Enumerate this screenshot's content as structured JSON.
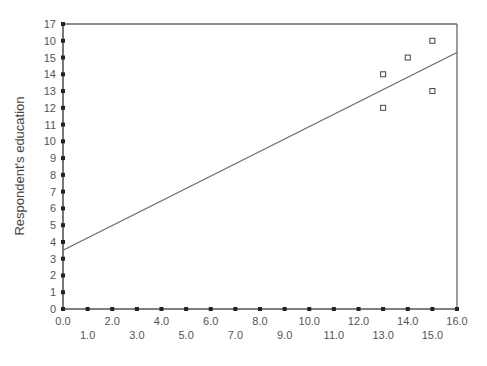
{
  "chart_data": {
    "type": "scatter",
    "title": "",
    "xlabel": "",
    "ylabel": "Respondent's education",
    "xlim": [
      0,
      16
    ],
    "ylim": [
      0,
      17
    ],
    "x_ticks": [
      0,
      1,
      2,
      3,
      4,
      5,
      6,
      7,
      8,
      9,
      10,
      11,
      12,
      13,
      14,
      15,
      16
    ],
    "x_tick_labels": [
      "0.0",
      "1.0",
      "2.0",
      "3.0",
      "4.0",
      "5.0",
      "6.0",
      "7.0",
      "8.0",
      "9.0",
      "10.0",
      "11.0",
      "12.0",
      "13.0",
      "14.0",
      "15.0",
      "16.0"
    ],
    "y_ticks": [
      0,
      1,
      2,
      3,
      4,
      5,
      6,
      7,
      8,
      9,
      10,
      11,
      12,
      13,
      14,
      15,
      16,
      17
    ],
    "y_tick_labels": [
      "0",
      "1",
      "2",
      "3",
      "4",
      "5",
      "6",
      "7",
      "8",
      "9",
      "10",
      "11",
      "12",
      "13",
      "14",
      "15",
      "10",
      "17"
    ],
    "grid": false,
    "legend": "none",
    "points": [
      {
        "x": 13,
        "y": 14
      },
      {
        "x": 13,
        "y": 12
      },
      {
        "x": 14,
        "y": 15
      },
      {
        "x": 15,
        "y": 16
      },
      {
        "x": 15,
        "y": 13
      }
    ],
    "fit_line": {
      "x": [
        0,
        16
      ],
      "y": [
        3.5,
        15.3
      ]
    }
  },
  "colors": {
    "axis": "#555555",
    "frame": "#666666",
    "marker": "#444444",
    "line": "#666666"
  }
}
